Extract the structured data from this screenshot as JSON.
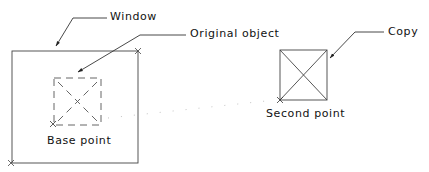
{
  "diagram": {
    "type": "cad-copy-command-illustration",
    "labels": {
      "window": "Window",
      "original_object": "Original object",
      "copy": "Copy",
      "base_point": "Base point",
      "second_point": "Second point"
    },
    "colors": {
      "line": "#333333",
      "text": "#111111",
      "background": "#ffffff",
      "displacement_dots": "#bbbbbb"
    }
  }
}
